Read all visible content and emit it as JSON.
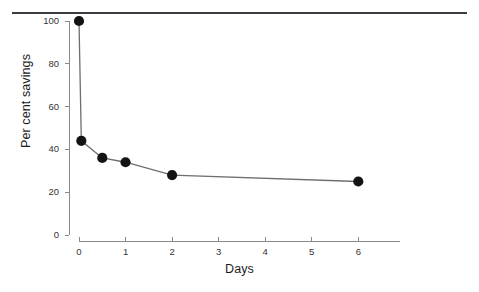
{
  "figure": {
    "background_color": "#ffffff",
    "rule_color": "#3b3b42",
    "axis_color": "#8a8a8a",
    "marker_color": "#141414",
    "line_color": "#6e6e6e"
  },
  "chart_data": {
    "type": "line",
    "title": "",
    "xlabel": "Days",
    "ylabel": "Per cent savings",
    "xlim": [
      -0.15,
      6.9
    ],
    "ylim": [
      0,
      104
    ],
    "xticks": [
      0,
      1,
      2,
      3,
      4,
      5,
      6
    ],
    "xtick_labels": [
      "0",
      "1",
      "2",
      "3",
      "4",
      "5",
      "6"
    ],
    "yticks": [
      0,
      20,
      40,
      60,
      80,
      100
    ],
    "ytick_labels": [
      "0",
      "20",
      "40",
      "60",
      "80",
      "100"
    ],
    "grid": false,
    "legend": false,
    "marker": "filled-circle",
    "series": [
      {
        "name": "Per cent savings",
        "x": [
          0,
          0.05,
          0.5,
          1,
          2,
          6
        ],
        "values": [
          100,
          44,
          36,
          34,
          28,
          25
        ]
      }
    ]
  }
}
